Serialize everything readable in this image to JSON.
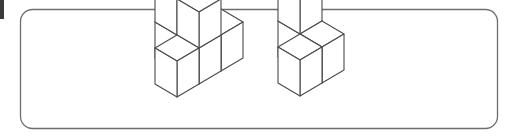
{
  "page": {
    "background_color": "#ffffff",
    "width": 513,
    "height": 138
  },
  "panel": {
    "name": "rounded-panel",
    "x": 20.5,
    "y": 9.5,
    "width": 477,
    "height": 119,
    "corner_radius": 12,
    "stroke_color": "#6e6e6e",
    "stroke_width": 1.3,
    "fill_color": "#ffffff"
  },
  "edge_marker": {
    "name": "page-edge-mark",
    "x": 0,
    "y": 0,
    "width": 4,
    "height": 19,
    "color": "#3a3a3a"
  },
  "drawing": {
    "stroke_color": "#4a4a4a",
    "stroke_width": 1.1,
    "face_fill": "#ffffff",
    "projection": "isometric",
    "cube_half_width": 22,
    "cube_half_depth": 13,
    "cube_height": 36
  },
  "figures": [
    {
      "id": "figure-left",
      "label": "Left cube figure",
      "origin_x": 177,
      "origin_y": 97,
      "cube_count": 6,
      "description": "Staircase solid: bottom row of three cubes with two cubes stacked on the rear pair",
      "cubes": [
        {
          "x": 0,
          "y": 0,
          "z": 0
        },
        {
          "x": 1,
          "y": 0,
          "z": 0
        },
        {
          "x": 2,
          "y": 0,
          "z": 0
        },
        {
          "x": 1,
          "y": 0,
          "z": 1
        },
        {
          "x": 1,
          "y": 1,
          "z": 1
        },
        {
          "x": 1,
          "y": 1,
          "z": 0
        }
      ]
    },
    {
      "id": "figure-right",
      "label": "Right cube figure",
      "origin_x": 300,
      "origin_y": 96,
      "cube_count": 4,
      "description": "L-shaped solid: three cubes on the base level with one cube stacked at the rear right",
      "cubes": [
        {
          "x": 0,
          "y": 0,
          "z": 0
        },
        {
          "x": 1,
          "y": 0,
          "z": 0
        },
        {
          "x": 1,
          "y": 1,
          "z": 0
        },
        {
          "x": 1,
          "y": 1,
          "z": 1
        }
      ]
    }
  ]
}
